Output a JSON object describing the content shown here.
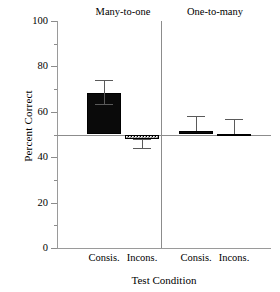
{
  "chart_data": {
    "type": "bar",
    "title": "",
    "xlabel": "Test Condition",
    "ylabel": "Percent Correct",
    "ylim": [
      0,
      100
    ],
    "yticks": [
      0,
      20,
      40,
      60,
      80,
      100
    ],
    "yticklabels": [
      "0",
      "20",
      "40",
      "60",
      "80",
      "100"
    ],
    "yminorticks": [
      10,
      30,
      50,
      70,
      90
    ],
    "grid": false,
    "legend": "none",
    "baseline": 50,
    "baseline_note": "chance line at 50 percent",
    "group_labels": [
      "Many-to-one",
      "One-to-many"
    ],
    "categories": [
      "Consis.",
      "Incons.",
      "Consis.",
      "Incons."
    ],
    "bars": [
      {
        "group": "Many-to-one",
        "category": "Consis.",
        "value": 68.5,
        "err_low": 63.0,
        "err_high": 74.0,
        "fill": "solid-black"
      },
      {
        "group": "Many-to-one",
        "category": "Incons.",
        "value": 48.0,
        "err_low": 43.5,
        "err_high": 48.0,
        "fill": "checkerboard"
      },
      {
        "group": "One-to-many",
        "category": "Consis.",
        "value": 51.7,
        "err_low": 51.7,
        "err_high": 58.0,
        "fill": "solid-black"
      },
      {
        "group": "One-to-many",
        "category": "Incons.",
        "value": 50.2,
        "err_low": 50.2,
        "err_high": 57.0,
        "fill": "checkerboard"
      }
    ],
    "colors": {
      "solid": "#0a0a0a",
      "axis": "#8c8c8c",
      "error": "#5a5a5a",
      "background": "#ffffff"
    }
  },
  "axis": {
    "y_label": "Percent Correct",
    "x_label": "Test Condition",
    "y_tick_0": "0",
    "y_tick_1": "20",
    "y_tick_2": "40",
    "y_tick_3": "60",
    "y_tick_4": "80",
    "y_tick_5": "100"
  },
  "groups": {
    "left_title": "Many-to-one",
    "right_title": "One-to-many"
  },
  "categories": {
    "c0": "Consis.",
    "c1": "Incons.",
    "c2": "Consis.",
    "c3": "Incons."
  }
}
